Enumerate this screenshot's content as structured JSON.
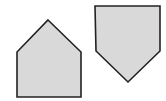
{
  "diagram": {
    "background": "#ffffff",
    "shapes": [
      {
        "id": "pentagon-upright",
        "kind": "pentagon",
        "orientation": "point-up",
        "points": "48,20 81,52 81,97 17,97 17,52",
        "fill": "#d9d9d9",
        "stroke": "#222222",
        "stroke_width": 1.6
      },
      {
        "id": "pentagon-inverted",
        "kind": "pentagon",
        "orientation": "point-down",
        "points": "95,6 160,6 160,51 128,82 96,51",
        "fill": "#d9d9d9",
        "stroke": "#222222",
        "stroke_width": 1.6
      }
    ]
  }
}
